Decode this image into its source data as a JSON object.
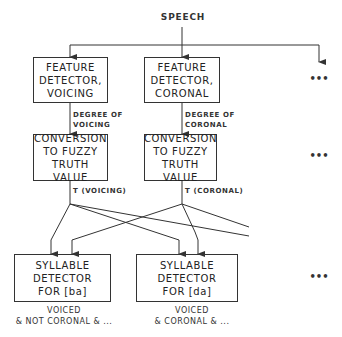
{
  "diagram": {
    "source_label": "SPEECH",
    "feature_detectors": [
      {
        "label": "FEATURE\nDETECTOR,\nVOICING",
        "output_label": "DEGREE OF\nVOICING"
      },
      {
        "label": "FEATURE\nDETECTOR,\nCORONAL",
        "output_label": "DEGREE OF\nCORONAL"
      }
    ],
    "converters": [
      {
        "label": "CONVERSION\nTO FUZZY\nTRUTH VALUE",
        "output_label": "T (VOICING)"
      },
      {
        "label": "CONVERSION\nTO FUZZY\nTRUTH VALUE",
        "output_label": "T (CORONAL)"
      }
    ],
    "syllable_detectors": [
      {
        "label": "SYLLABLE\nDETECTOR\nFOR [ba]",
        "condition": "VOICED\n& NOT CORONAL & ..."
      },
      {
        "label": "SYLLABLE\nDETECTOR\nFOR [da]",
        "condition": "VOICED\n& CORONAL & ..."
      }
    ],
    "ellipsis": "•••",
    "line_color": "#333333"
  }
}
